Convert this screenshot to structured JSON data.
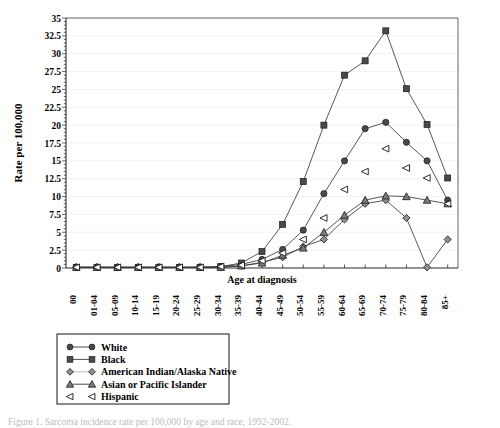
{
  "chart_data": {
    "type": "line",
    "title": "",
    "xlabel": "Age at diagnosis",
    "ylabel": "Rate per 100,000",
    "ylim": [
      0,
      35
    ],
    "ytick_step": 2.5,
    "grid": true,
    "legend_position": "below-left",
    "categories": [
      "00",
      "01-04",
      "05-09",
      "10-14",
      "15-19",
      "20-24",
      "25-29",
      "30-34",
      "35-39",
      "40-44",
      "45-49",
      "50-54",
      "55-59",
      "60-64",
      "65-69",
      "70-74",
      "75-79",
      "80-84",
      "85+"
    ],
    "ytick_labels": [
      "0",
      "2.5",
      "5",
      "7.5",
      "10",
      "12.5",
      "15",
      "17.5",
      "20",
      "22.5",
      "25",
      "27.5",
      "30",
      "32.5",
      "35"
    ],
    "series": [
      {
        "name": "White",
        "marker": "circle",
        "connected": true,
        "values": [
          0.1,
          0.1,
          0.1,
          0.1,
          0.1,
          0.1,
          0.1,
          0.2,
          0.5,
          1.2,
          2.6,
          5.3,
          10.4,
          15.0,
          19.5,
          20.4,
          17.6,
          15.0,
          9.5
        ]
      },
      {
        "name": "Black",
        "marker": "square",
        "connected": true,
        "values": [
          0.1,
          0.1,
          0.1,
          0.1,
          0.1,
          0.1,
          0.1,
          0.2,
          0.7,
          2.3,
          6.1,
          12.1,
          20.0,
          27.0,
          29.0,
          33.2,
          25.1,
          20.1,
          12.6
        ]
      },
      {
        "name": "American Indian/Alaska Native",
        "marker": "diamond",
        "connected": true,
        "values": [
          0.1,
          0.1,
          0.1,
          0.1,
          0.1,
          0.1,
          0.1,
          0.1,
          0.3,
          0.8,
          1.5,
          3.0,
          4.0,
          6.8,
          9.0,
          9.5,
          7.0,
          0.1,
          4.0
        ]
      },
      {
        "name": "Asian or Pacific Islander",
        "marker": "triangle",
        "connected": true,
        "values": [
          0.1,
          0.1,
          0.1,
          0.1,
          0.1,
          0.1,
          0.1,
          0.1,
          0.3,
          0.7,
          1.8,
          2.8,
          5.0,
          7.4,
          9.5,
          10.1,
          10.0,
          9.5,
          9.0
        ]
      },
      {
        "name": "Hispanic",
        "marker": "left-triangle",
        "connected": false,
        "values": [
          0.1,
          0.1,
          0.1,
          0.1,
          0.1,
          0.1,
          0.1,
          0.2,
          0.4,
          1.0,
          2.1,
          4.0,
          7.0,
          11.0,
          13.5,
          16.7,
          14.0,
          12.6,
          9.0
        ]
      }
    ]
  },
  "legend": {
    "items": [
      {
        "label": "White",
        "marker": "circle"
      },
      {
        "label": "Black",
        "marker": "square"
      },
      {
        "label": "American Indian/Alaska Native",
        "marker": "diamond"
      },
      {
        "label": "Asian or Pacific Islander",
        "marker": "triangle"
      },
      {
        "label": "Hispanic",
        "marker": "left-triangle"
      }
    ]
  },
  "caption": {
    "text": "Figure 1. Sarcoma incidence rate per 100,000 by age and race, 1992-2002."
  },
  "colors": {
    "line": "#3a3a3a",
    "marker_fill": "#4a4a4a",
    "axis": "#2a2a2a",
    "grid": "#e9e9e9"
  }
}
